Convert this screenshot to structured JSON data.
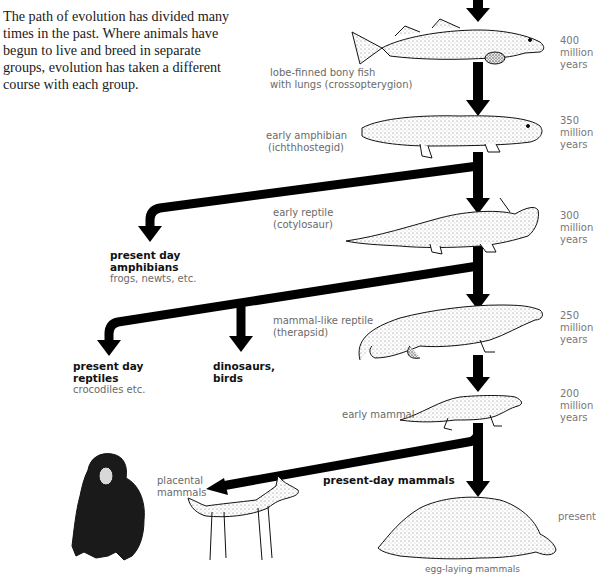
{
  "intro": {
    "text": "The path of evolution has divided many times in the past. Where animals have begun to live and breed in separate groups, evolution has taken a different course with each group."
  },
  "timeline": [
    {
      "line1": "400",
      "line2": "million",
      "line3": "years"
    },
    {
      "line1": "350",
      "line2": "million",
      "line3": "years"
    },
    {
      "line1": "300",
      "line2": "million",
      "line3": "years"
    },
    {
      "line1": "250",
      "line2": "million",
      "line3": "years"
    },
    {
      "line1": "200",
      "line2": "million",
      "line3": "years"
    },
    {
      "line1": "present",
      "line2": "",
      "line3": ""
    }
  ],
  "stages": [
    {
      "name": "lobe-finned-fish",
      "line1": "lobe-finned bony fish",
      "line2": "with lungs (crossopterygion)",
      "icon": "fish-icon"
    },
    {
      "name": "early-amphibian",
      "line1": "early amphibian",
      "line2": "(ichthhostegid)",
      "icon": "amphibian-icon"
    },
    {
      "name": "early-reptile",
      "line1": "early reptile",
      "line2": "(cotylosaur)",
      "icon": "reptile-icon"
    },
    {
      "name": "mammal-like-reptile",
      "line1": "mammal-like reptile",
      "line2": "(therapsid)",
      "icon": "therapsid-icon"
    },
    {
      "name": "early-mammal",
      "line1": "early mammal",
      "line2": "",
      "icon": "early-mammal-icon"
    }
  ],
  "branches": {
    "amphibians": {
      "title1": "present day",
      "title2": "amphibians",
      "sub": "frogs, newts, etc."
    },
    "reptiles": {
      "title1": "present day",
      "title2": "reptiles",
      "sub": "crocodiles etc."
    },
    "dinosaurs": {
      "title1": "dinosaurs,",
      "title2": "birds"
    },
    "mammals": {
      "title": "present-day mammals"
    },
    "placental": {
      "line1": "placental",
      "line2": "mammals"
    },
    "egg_laying": {
      "label": "egg-laying mammals"
    }
  },
  "colors": {
    "arrow": "#000000",
    "label": "#6a6a6a",
    "text": "#1a1a1a"
  }
}
